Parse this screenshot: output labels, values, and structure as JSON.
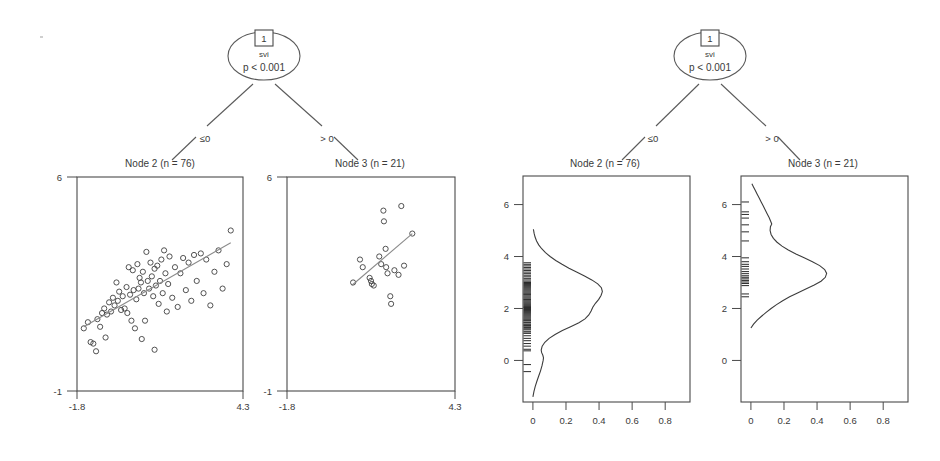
{
  "figure": {
    "background": "#ffffff",
    "line_color": "#555555",
    "point_color": "#3f3f3f",
    "fit_line_color": "#8a8a8a"
  },
  "panels": [
    {
      "key": "left",
      "kind": "scatter",
      "root": {
        "id": "1",
        "variable": "svi",
        "pvalue": "p < 0.001"
      },
      "edges": [
        {
          "label": "≤0"
        },
        {
          "label": "> 0"
        }
      ],
      "children": [
        {
          "title": "Node 2 (n = 76)",
          "y_top_label": "6",
          "y_bottom_label": "-1",
          "x_left_label": "-1.8",
          "x_right_label": "4.3"
        },
        {
          "title": "Node 3 (n = 21)",
          "y_top_label": "6",
          "y_bottom_label": "-1",
          "x_left_label": "-1.8",
          "x_right_label": "4.3"
        }
      ]
    },
    {
      "key": "right",
      "kind": "density",
      "root": {
        "id": "1",
        "variable": "svi",
        "pvalue": "p < 0.001"
      },
      "edges": [
        {
          "label": "≤0"
        },
        {
          "label": "> 0"
        }
      ],
      "children": [
        {
          "title": "Node 2 (n = 76)",
          "y_ticks": [
            "0",
            "2",
            "4",
            "6"
          ],
          "x_ticks": [
            "0",
            "0.2",
            "0.4",
            "0.6",
            "0.8"
          ]
        },
        {
          "title": "Node 3 (n = 21)",
          "y_ticks": [
            "0",
            "2",
            "4",
            "6"
          ],
          "x_ticks": [
            "0",
            "0.2",
            "0.4",
            "0.6",
            "0.8"
          ]
        }
      ]
    }
  ],
  "chart_data": [
    {
      "type": "scatter",
      "panel": "left-node-2",
      "title": "Node 2 (n = 76)",
      "xlabel": "",
      "ylabel": "",
      "xlim": [
        -1.8,
        4.3
      ],
      "ylim": [
        -1,
        6
      ],
      "xtick_labels": [
        "-1.8",
        "4.3"
      ],
      "ytick_labels": [
        "-1",
        "6"
      ],
      "grid": false,
      "legend": "none",
      "n": 76,
      "fit_line": {
        "x": [
          -1.55,
          3.85
        ],
        "y": [
          1.1,
          3.85
        ]
      },
      "points": [
        [
          -1.55,
          1.05
        ],
        [
          -1.4,
          1.25
        ],
        [
          -1.3,
          0.6
        ],
        [
          -1.2,
          0.55
        ],
        [
          -1.05,
          1.35
        ],
        [
          -0.95,
          1.1
        ],
        [
          -0.88,
          1.55
        ],
        [
          -0.8,
          1.7
        ],
        [
          -0.75,
          0.75
        ],
        [
          -0.7,
          1.5
        ],
        [
          -0.62,
          1.9
        ],
        [
          -0.55,
          1.6
        ],
        [
          -0.48,
          2.05
        ],
        [
          -0.42,
          1.8
        ],
        [
          -0.35,
          2.55
        ],
        [
          -0.3,
          1.95
        ],
        [
          -0.25,
          2.25
        ],
        [
          -0.18,
          1.65
        ],
        [
          -0.12,
          2.1
        ],
        [
          -0.05,
          1.7
        ],
        [
          0.02,
          2.4
        ],
        [
          0.05,
          1.55
        ],
        [
          0.1,
          3.05
        ],
        [
          0.15,
          2.15
        ],
        [
          0.2,
          1.3
        ],
        [
          0.25,
          2.95
        ],
        [
          0.28,
          2.3
        ],
        [
          0.33,
          1.05
        ],
        [
          0.38,
          2.0
        ],
        [
          0.42,
          3.15
        ],
        [
          0.46,
          2.35
        ],
        [
          0.5,
          2.7
        ],
        [
          0.55,
          2.55
        ],
        [
          0.58,
          0.7
        ],
        [
          0.62,
          2.9
        ],
        [
          0.66,
          2.2
        ],
        [
          0.7,
          1.3
        ],
        [
          0.75,
          3.55
        ],
        [
          0.8,
          2.6
        ],
        [
          0.85,
          2.35
        ],
        [
          0.9,
          3.2
        ],
        [
          0.95,
          2.75
        ],
        [
          1.0,
          2.1
        ],
        [
          1.05,
          3.0
        ],
        [
          1.1,
          2.45
        ],
        [
          1.15,
          3.1
        ],
        [
          1.2,
          1.85
        ],
        [
          1.25,
          2.6
        ],
        [
          1.3,
          3.3
        ],
        [
          1.35,
          2.2
        ],
        [
          1.4,
          3.6
        ],
        [
          1.45,
          2.85
        ],
        [
          1.5,
          1.6
        ],
        [
          1.55,
          2.5
        ],
        [
          1.6,
          3.4
        ],
        [
          1.7,
          2.05
        ],
        [
          1.8,
          3.05
        ],
        [
          1.9,
          1.75
        ],
        [
          2.0,
          2.85
        ],
        [
          2.1,
          3.35
        ],
        [
          2.2,
          2.3
        ],
        [
          2.3,
          3.2
        ],
        [
          2.4,
          1.95
        ],
        [
          2.5,
          3.45
        ],
        [
          2.6,
          2.6
        ],
        [
          2.75,
          3.5
        ],
        [
          2.85,
          2.2
        ],
        [
          2.95,
          3.3
        ],
        [
          3.1,
          1.8
        ],
        [
          3.25,
          2.9
        ],
        [
          3.4,
          3.6
        ],
        [
          3.55,
          2.35
        ],
        [
          3.7,
          3.15
        ],
        [
          3.85,
          4.25
        ],
        [
          1.05,
          0.35
        ],
        [
          -1.1,
          0.3
        ]
      ]
    },
    {
      "type": "scatter",
      "panel": "left-node-3",
      "title": "Node 3 (n = 21)",
      "xlabel": "",
      "ylabel": "",
      "xlim": [
        -1.8,
        4.3
      ],
      "ylim": [
        -1,
        6
      ],
      "xtick_labels": [
        "-1.8",
        "4.3"
      ],
      "ytick_labels": [
        "-1",
        "6"
      ],
      "grid": false,
      "legend": "none",
      "n": 21,
      "fit_line": {
        "x": [
          0.55,
          2.75
        ],
        "y": [
          2.45,
          4.15
        ]
      },
      "points": [
        [
          0.6,
          2.55
        ],
        [
          0.85,
          3.3
        ],
        [
          0.95,
          3.05
        ],
        [
          1.2,
          2.7
        ],
        [
          1.25,
          2.6
        ],
        [
          1.28,
          2.5
        ],
        [
          1.35,
          2.45
        ],
        [
          1.55,
          3.4
        ],
        [
          1.62,
          3.15
        ],
        [
          1.7,
          4.9
        ],
        [
          1.72,
          4.55
        ],
        [
          1.78,
          3.65
        ],
        [
          1.8,
          3.05
        ],
        [
          1.85,
          2.85
        ],
        [
          1.95,
          2.1
        ],
        [
          1.98,
          1.85
        ],
        [
          2.1,
          2.95
        ],
        [
          2.25,
          2.8
        ],
        [
          2.35,
          5.05
        ],
        [
          2.45,
          3.1
        ],
        [
          2.75,
          4.15
        ]
      ]
    },
    {
      "type": "line",
      "subtype": "density",
      "panel": "right-node-2",
      "title": "Node 2 (n = 76)",
      "xlabel": "",
      "ylabel": "",
      "orientation": "horizontal-density",
      "xlim": [
        -0.06,
        0.95
      ],
      "ylim": [
        -1.6,
        7.1
      ],
      "xtick_values": [
        0,
        0.2,
        0.4,
        0.6,
        0.8
      ],
      "xtick_labels": [
        "0",
        "0.2",
        "0.4",
        "0.6",
        "0.8"
      ],
      "ytick_values": [
        0,
        2,
        4,
        6
      ],
      "ytick_labels": [
        "0",
        "2",
        "4",
        "6"
      ],
      "grid": false,
      "legend": "none",
      "density": [
        [
          -1.4,
          0.0
        ],
        [
          -1.2,
          0.006
        ],
        [
          -1.0,
          0.014
        ],
        [
          -0.8,
          0.024
        ],
        [
          -0.6,
          0.035
        ],
        [
          -0.4,
          0.046
        ],
        [
          -0.2,
          0.055
        ],
        [
          0.0,
          0.062
        ],
        [
          0.1,
          0.064
        ],
        [
          0.2,
          0.06
        ],
        [
          0.3,
          0.053
        ],
        [
          0.4,
          0.05
        ],
        [
          0.55,
          0.056
        ],
        [
          0.7,
          0.072
        ],
        [
          0.85,
          0.098
        ],
        [
          1.0,
          0.134
        ],
        [
          1.15,
          0.178
        ],
        [
          1.3,
          0.228
        ],
        [
          1.45,
          0.278
        ],
        [
          1.6,
          0.315
        ],
        [
          1.75,
          0.338
        ],
        [
          1.9,
          0.352
        ],
        [
          2.05,
          0.362
        ],
        [
          2.2,
          0.378
        ],
        [
          2.35,
          0.398
        ],
        [
          2.5,
          0.412
        ],
        [
          2.65,
          0.42
        ],
        [
          2.8,
          0.414
        ],
        [
          2.95,
          0.392
        ],
        [
          3.1,
          0.356
        ],
        [
          3.25,
          0.312
        ],
        [
          3.4,
          0.264
        ],
        [
          3.55,
          0.218
        ],
        [
          3.7,
          0.176
        ],
        [
          3.85,
          0.138
        ],
        [
          4.0,
          0.104
        ],
        [
          4.15,
          0.076
        ],
        [
          4.3,
          0.053
        ],
        [
          4.45,
          0.035
        ],
        [
          4.6,
          0.022
        ],
        [
          4.75,
          0.013
        ],
        [
          4.9,
          0.007
        ],
        [
          5.05,
          0.003
        ]
      ],
      "rug_values": [
        -0.43,
        -0.16,
        0.37,
        0.43,
        0.65,
        0.76,
        0.85,
        1.05,
        1.12,
        1.22,
        1.27,
        1.32,
        1.37,
        1.4,
        1.45,
        1.47,
        1.52,
        1.56,
        1.6,
        1.64,
        1.68,
        1.72,
        1.76,
        1.8,
        1.84,
        1.88,
        1.92,
        1.96,
        2.0,
        2.04,
        2.08,
        2.12,
        2.16,
        2.2,
        2.24,
        2.28,
        2.32,
        2.36,
        2.4,
        2.44,
        2.48,
        2.52,
        2.56,
        2.6,
        2.64,
        2.68,
        2.72,
        2.76,
        2.8,
        2.84,
        2.88,
        2.92,
        2.96,
        3.0,
        3.05,
        3.1,
        3.16,
        3.22,
        3.28,
        3.34,
        3.4,
        3.46,
        3.52,
        3.58,
        3.64,
        3.7,
        3.76,
        2.05,
        2.34,
        2.55,
        1.18,
        1.34,
        1.55,
        1.05,
        0.95,
        0.55
      ]
    },
    {
      "type": "line",
      "subtype": "density",
      "panel": "right-node-3",
      "title": "Node 3 (n = 21)",
      "xlabel": "",
      "ylabel": "",
      "orientation": "horizontal-density",
      "xlim": [
        -0.06,
        0.95
      ],
      "ylim": [
        -1.6,
        7.1
      ],
      "xtick_values": [
        0,
        0.2,
        0.4,
        0.6,
        0.8
      ],
      "xtick_labels": [
        "0",
        "0.2",
        "0.4",
        "0.6",
        "0.8"
      ],
      "ytick_values": [
        0,
        2,
        4,
        6
      ],
      "ytick_labels": [
        "0",
        "2",
        "4",
        "6"
      ],
      "grid": false,
      "legend": "none",
      "density": [
        [
          1.25,
          0.0
        ],
        [
          1.4,
          0.016
        ],
        [
          1.55,
          0.038
        ],
        [
          1.7,
          0.064
        ],
        [
          1.85,
          0.092
        ],
        [
          2.0,
          0.122
        ],
        [
          2.15,
          0.155
        ],
        [
          2.3,
          0.192
        ],
        [
          2.45,
          0.234
        ],
        [
          2.6,
          0.282
        ],
        [
          2.75,
          0.332
        ],
        [
          2.9,
          0.383
        ],
        [
          3.05,
          0.424
        ],
        [
          3.2,
          0.45
        ],
        [
          3.35,
          0.458
        ],
        [
          3.5,
          0.446
        ],
        [
          3.65,
          0.416
        ],
        [
          3.8,
          0.372
        ],
        [
          3.95,
          0.322
        ],
        [
          4.1,
          0.272
        ],
        [
          4.25,
          0.226
        ],
        [
          4.4,
          0.188
        ],
        [
          4.55,
          0.158
        ],
        [
          4.7,
          0.136
        ],
        [
          4.85,
          0.122
        ],
        [
          5.0,
          0.116
        ],
        [
          5.15,
          0.118
        ],
        [
          5.25,
          0.126
        ],
        [
          5.35,
          0.12
        ],
        [
          5.5,
          0.11
        ],
        [
          5.65,
          0.098
        ],
        [
          5.8,
          0.086
        ],
        [
          5.95,
          0.074
        ],
        [
          6.1,
          0.062
        ],
        [
          6.25,
          0.05
        ],
        [
          6.4,
          0.038
        ],
        [
          6.55,
          0.026
        ],
        [
          6.7,
          0.014
        ],
        [
          6.8,
          0.006
        ]
      ],
      "rug_values": [
        2.45,
        2.56,
        2.88,
        2.96,
        3.02,
        3.08,
        3.14,
        3.2,
        3.26,
        3.34,
        3.42,
        3.52,
        3.62,
        3.7,
        3.8,
        3.95,
        4.6,
        4.95,
        5.22,
        5.48,
        5.62,
        5.72,
        6.1
      ]
    }
  ]
}
